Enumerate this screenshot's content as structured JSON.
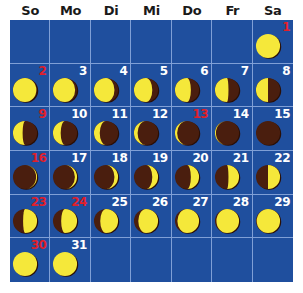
{
  "calendar": {
    "weekdays": [
      "So",
      "Mo",
      "Di",
      "Mi",
      "Do",
      "Fr",
      "Sa"
    ],
    "leading_blank_days": 6,
    "colors": {
      "grid_background": "#1f4f9e",
      "grid_lines": "#7f9fd6",
      "moon_lit": "#f5e83a",
      "moon_dark": "#4a1e0e",
      "moon_rim": "#2a0f06",
      "day_number": "#ffffff",
      "day_number_highlight": "#e0202a"
    },
    "days": [
      {
        "day": "1",
        "red": true,
        "lit": 1.0,
        "side": "full"
      },
      {
        "day": "2",
        "red": true,
        "lit": 0.97,
        "side": "left"
      },
      {
        "day": "3",
        "red": false,
        "lit": 0.92,
        "side": "left"
      },
      {
        "day": "4",
        "red": false,
        "lit": 0.85,
        "side": "left"
      },
      {
        "day": "5",
        "red": false,
        "lit": 0.76,
        "side": "left"
      },
      {
        "day": "6",
        "red": false,
        "lit": 0.66,
        "side": "left"
      },
      {
        "day": "7",
        "red": false,
        "lit": 0.56,
        "side": "left"
      },
      {
        "day": "8",
        "red": false,
        "lit": 0.5,
        "side": "left"
      },
      {
        "day": "9",
        "red": true,
        "lit": 0.4,
        "side": "left"
      },
      {
        "day": "10",
        "red": false,
        "lit": 0.32,
        "side": "left"
      },
      {
        "day": "11",
        "red": false,
        "lit": 0.24,
        "side": "left"
      },
      {
        "day": "12",
        "red": false,
        "lit": 0.15,
        "side": "left"
      },
      {
        "day": "13",
        "red": true,
        "lit": 0.09,
        "side": "left"
      },
      {
        "day": "14",
        "red": false,
        "lit": 0.04,
        "side": "left"
      },
      {
        "day": "15",
        "red": false,
        "lit": 0.0,
        "side": "new"
      },
      {
        "day": "16",
        "red": true,
        "lit": 0.04,
        "side": "right"
      },
      {
        "day": "17",
        "red": false,
        "lit": 0.09,
        "side": "right"
      },
      {
        "day": "18",
        "red": false,
        "lit": 0.15,
        "side": "right"
      },
      {
        "day": "19",
        "red": false,
        "lit": 0.24,
        "side": "right"
      },
      {
        "day": "20",
        "red": false,
        "lit": 0.34,
        "side": "right"
      },
      {
        "day": "21",
        "red": false,
        "lit": 0.44,
        "side": "right"
      },
      {
        "day": "22",
        "red": false,
        "lit": 0.5,
        "side": "right"
      },
      {
        "day": "23",
        "red": true,
        "lit": 0.58,
        "side": "right"
      },
      {
        "day": "24",
        "red": true,
        "lit": 0.66,
        "side": "right"
      },
      {
        "day": "25",
        "red": false,
        "lit": 0.74,
        "side": "right"
      },
      {
        "day": "26",
        "red": false,
        "lit": 0.82,
        "side": "right"
      },
      {
        "day": "27",
        "red": false,
        "lit": 0.9,
        "side": "right"
      },
      {
        "day": "28",
        "red": false,
        "lit": 0.94,
        "side": "right"
      },
      {
        "day": "29",
        "red": false,
        "lit": 0.97,
        "side": "right"
      },
      {
        "day": "30",
        "red": true,
        "lit": 1.0,
        "side": "full"
      },
      {
        "day": "31",
        "red": false,
        "lit": 1.0,
        "side": "full"
      }
    ]
  }
}
